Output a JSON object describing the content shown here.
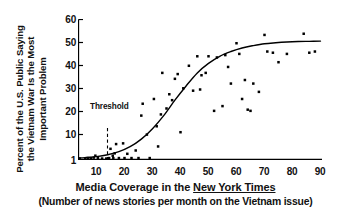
{
  "chart_data": {
    "type": "scatter",
    "title": "",
    "xlabel": "Media Coverage in the New York Times",
    "xlabel_sub": "(Number of news stories per month on the Vietnam issue)",
    "xlabel_part_plain": "Media Coverage in the ",
    "xlabel_part_italic": "New York Times",
    "ylabel_line1": "Percent of the U.S. Public Saying",
    "ylabel_line2": "the Vietnam War Is the Most",
    "ylabel_line3": "Important Problem",
    "xlim": [
      0,
      93
    ],
    "ylim": [
      0,
      62
    ],
    "xticks": [
      10,
      20,
      30,
      40,
      50,
      60,
      70,
      80,
      90
    ],
    "yticks": [
      1,
      10,
      20,
      30,
      40,
      50,
      60
    ],
    "grid": false,
    "legend": "none",
    "annotations": [
      {
        "text": "Threshold",
        "x": 14,
        "y": 26,
        "line": "dashed-vertical",
        "x_value": 14
      }
    ],
    "series": [
      {
        "name": "Poll responses",
        "type": "scatter",
        "marker": "square",
        "color": "#000000",
        "points": [
          [
            4,
            1.4
          ],
          [
            6,
            1.4
          ],
          [
            7,
            1.6
          ],
          [
            8,
            1.6
          ],
          [
            9,
            1.8
          ],
          [
            9.6,
            2.6
          ],
          [
            10.5,
            1.6
          ],
          [
            12,
            1.4
          ],
          [
            13.5,
            1.4
          ],
          [
            14.5,
            1.6
          ],
          [
            15,
            5.5
          ],
          [
            15.8,
            2.6
          ],
          [
            16,
            1.6
          ],
          [
            16.5,
            3.6
          ],
          [
            17,
            7.5
          ],
          [
            18,
            1.6
          ],
          [
            19.5,
            7.8
          ],
          [
            20,
            1.6
          ],
          [
            21,
            3.4
          ],
          [
            22.5,
            1.6
          ],
          [
            24,
            4.8
          ],
          [
            25,
            1.6
          ],
          [
            26,
            19.5
          ],
          [
            26.5,
            24.5
          ],
          [
            28,
            11.5
          ],
          [
            29,
            1.6
          ],
          [
            30.5,
            26.5
          ],
          [
            31.5,
            15.0
          ],
          [
            32,
            6.5
          ],
          [
            33,
            20.0
          ],
          [
            33.5,
            37.5
          ],
          [
            35,
            22.5
          ],
          [
            36,
            28.5
          ],
          [
            37,
            26.0
          ],
          [
            38,
            35.0
          ],
          [
            39,
            37.0
          ],
          [
            40,
            12.5
          ],
          [
            41,
            31.0
          ],
          [
            43,
            40.5
          ],
          [
            44.5,
            30.0
          ],
          [
            46,
            44.5
          ],
          [
            47,
            30.5
          ],
          [
            47.5,
            36.5
          ],
          [
            49,
            37.5
          ],
          [
            50,
            44.5
          ],
          [
            52,
            21.5
          ],
          [
            53,
            44.0
          ],
          [
            55,
            23.5
          ],
          [
            56,
            45.0
          ],
          [
            57,
            40.0
          ],
          [
            58,
            33.0
          ],
          [
            60,
            50.0
          ],
          [
            61,
            45.5
          ],
          [
            62,
            26.5
          ],
          [
            63,
            34.5
          ],
          [
            64,
            22.0
          ],
          [
            65,
            21.5
          ],
          [
            66,
            33.0
          ],
          [
            68,
            29.5
          ],
          [
            70,
            53.5
          ],
          [
            71,
            46.5
          ],
          [
            73,
            46.0
          ],
          [
            75,
            42.0
          ],
          [
            78,
            45.5
          ],
          [
            84,
            54.0
          ],
          [
            86,
            46.0
          ],
          [
            88,
            46.5
          ]
        ]
      },
      {
        "name": "Fitted logistic curve",
        "type": "line",
        "color": "#000000",
        "points": [
          [
            2,
            1.6
          ],
          [
            6,
            1.8
          ],
          [
            10,
            2.2
          ],
          [
            14,
            3.0
          ],
          [
            18,
            4.3
          ],
          [
            22,
            6.4
          ],
          [
            26,
            9.6
          ],
          [
            30,
            14.0
          ],
          [
            34,
            19.5
          ],
          [
            38,
            26.0
          ],
          [
            42,
            32.0
          ],
          [
            46,
            37.5
          ],
          [
            50,
            41.5
          ],
          [
            54,
            44.5
          ],
          [
            58,
            46.5
          ],
          [
            62,
            48.0
          ],
          [
            66,
            49.0
          ],
          [
            70,
            49.8
          ],
          [
            74,
            50.2
          ],
          [
            78,
            50.5
          ],
          [
            82,
            50.7
          ],
          [
            86,
            50.8
          ],
          [
            90,
            50.9
          ]
        ]
      }
    ]
  }
}
